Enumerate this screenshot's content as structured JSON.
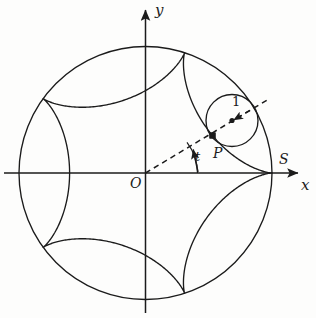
{
  "figure": {
    "background_color": "#fdfdfc",
    "stroke_color": "#1b1b1b"
  },
  "axes": {
    "x_label": "x",
    "y_label": "y",
    "origin_label": "O",
    "origin": {
      "x": 145.5,
      "y": 173
    },
    "x_axis": {
      "x1": 4,
      "y1": 173,
      "x2": 300,
      "y2": 173
    },
    "y_axis": {
      "x1": 145.5,
      "y1": 313,
      "x2": 145.5,
      "y2": 8
    }
  },
  "labels": {
    "point_S": "S",
    "point_P": "P",
    "angle_t": "t",
    "radius_one": "1"
  },
  "chart_data": {
    "type": "line",
    "xlabel": "x",
    "ylabel": "y",
    "grid": false,
    "legend": null,
    "big_circle": {
      "center": [
        145.5,
        173
      ],
      "radius": 126.5,
      "label": null
    },
    "rolling_circle": {
      "center": [
        232,
        120.5
      ],
      "radius": 26,
      "radius_label": "1",
      "center_marker": "dot"
    },
    "hypocycloid": {
      "cusp_count": 5,
      "R": 126.5,
      "r": 25.3,
      "cusps": [
        {
          "label": "S",
          "x": 272,
          "y": 173,
          "angle_deg": 0
        },
        {
          "label": null,
          "x": 184.6,
          "y": 52.7,
          "angle_deg": 72
        },
        {
          "label": null,
          "x": 43.2,
          "y": 98.6,
          "angle_deg": 144
        },
        {
          "label": null,
          "x": 43.2,
          "y": 247.4,
          "angle_deg": 216
        },
        {
          "label": null,
          "x": 184.6,
          "y": 293.3,
          "angle_deg": 288
        }
      ]
    },
    "traced_point": {
      "label": "P",
      "x": 212.5,
      "y": 135.5,
      "marker": "square"
    },
    "angle": {
      "label": "t",
      "vertex": [
        145.5,
        173
      ],
      "from_deg": 0,
      "to_deg": 37,
      "arc_radius": 52
    },
    "ray": {
      "description": "dashed line from O through P to rolling circle center and beyond",
      "from": [
        145.5,
        173
      ],
      "to": [
        268,
        99
      ],
      "style": "dashed",
      "arrow_at_center": true
    },
    "annotations": [
      {
        "text": "S",
        "x": 279,
        "y": 158,
        "meaning": "start cusp on positive x-axis"
      },
      {
        "text": "P",
        "x": 213,
        "y": 152,
        "meaning": "tracing point on rolling circle"
      },
      {
        "text": "t",
        "x": 197,
        "y": 157,
        "meaning": "polar angle of rolling circle center"
      },
      {
        "text": "1",
        "x": 234,
        "y": 101,
        "meaning": "radius of rolling circle"
      },
      {
        "text": "O",
        "x": 132,
        "y": 183,
        "meaning": "origin"
      },
      {
        "text": "y",
        "x": 157,
        "y": 12,
        "meaning": "vertical axis label"
      },
      {
        "text": "x",
        "x": 303,
        "y": 186,
        "meaning": "horizontal axis label"
      }
    ]
  }
}
